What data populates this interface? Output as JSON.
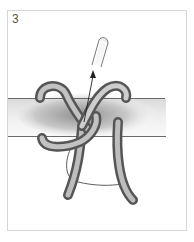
{
  "figure": {
    "step_number": "3",
    "colors": {
      "frame_border": "#d6d6d6",
      "rope": "#8a8a8a",
      "rope_highlight": "#c8c8c8",
      "bar_shade": "#9a9a9a",
      "line": "#333333"
    }
  }
}
